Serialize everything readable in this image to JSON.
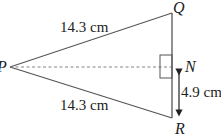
{
  "diagram": {
    "type": "isosceles-triangle",
    "points": {
      "P": {
        "label": "P"
      },
      "Q": {
        "label": "Q"
      },
      "R": {
        "label": "R"
      },
      "N": {
        "label": "N"
      }
    },
    "measurements": {
      "PQ": "14.3 cm",
      "PR": "14.3 cm",
      "NR": "4.9 cm"
    },
    "annotations": {
      "right_angle_at": "N",
      "dashed_segment": "PN"
    },
    "colors": {
      "line": "#555555",
      "text": "#222222"
    }
  }
}
